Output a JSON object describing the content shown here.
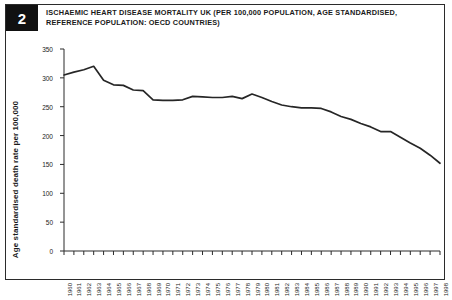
{
  "figure": {
    "number": "2",
    "title": "ISCHAEMIC HEART DISEASE MORTALITY UK (PER 100,000 POPULATION, AGE STANDARDISED, REFERENCE POPULATION: OECD COUNTRIES)"
  },
  "chart_data": {
    "type": "line",
    "title": "ISCHAEMIC HEART DISEASE MORTALITY UK (PER 100,000 POPULATION, AGE STANDARDISED, REFERENCE POPULATION: OECD COUNTRIES)",
    "xlabel": "",
    "ylabel": "Age standardised death rate per 100,000",
    "ylim": [
      0,
      350
    ],
    "yticks": [
      0,
      50,
      100,
      150,
      200,
      250,
      300,
      350
    ],
    "ytick_labels": [
      "0",
      "50",
      "100",
      "150",
      "200",
      "250",
      "300",
      "350"
    ],
    "grid": false,
    "legend": "none",
    "line_color": "#262626",
    "categories": [
      "1960",
      "1961",
      "1962",
      "1963",
      "1964",
      "1965",
      "1966",
      "1967",
      "1968",
      "1969",
      "1970",
      "1971",
      "1972",
      "1973",
      "1974",
      "1975",
      "1976",
      "1977",
      "1978",
      "1979",
      "1980",
      "1981",
      "1982",
      "1983",
      "1984",
      "1985",
      "1986",
      "1987",
      "1988",
      "1989",
      "1990",
      "1991",
      "1992",
      "1993",
      "1994",
      "1995",
      "1996",
      "1997",
      "1998"
    ],
    "values": [
      305,
      310,
      314,
      320,
      296,
      288,
      287,
      279,
      278,
      262,
      261,
      261,
      262,
      268,
      267,
      266,
      266,
      268,
      264,
      272,
      266,
      259,
      253,
      250,
      248,
      248,
      247,
      241,
      233,
      228,
      221,
      215,
      207,
      207,
      197,
      187,
      178,
      166,
      152
    ]
  }
}
